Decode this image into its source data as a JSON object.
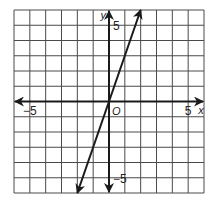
{
  "chart_data": {
    "type": "line",
    "title": "",
    "xlabel": "x",
    "ylabel": "y",
    "origin_label": "O",
    "xlim": [
      -6,
      6
    ],
    "ylim": [
      -6,
      6
    ],
    "grid": true,
    "grid_step": 1,
    "x_tick_labels": [
      {
        "value": -5,
        "label": "−5"
      },
      {
        "value": 5,
        "label": "5"
      }
    ],
    "y_tick_labels": [
      {
        "value": 5,
        "label": "5"
      },
      {
        "value": -5,
        "label": "−5"
      }
    ],
    "series": [
      {
        "name": "y = 3x",
        "equation": "y = 3x",
        "slope": 3,
        "intercept": 0,
        "x": [
          -2,
          0,
          2
        ],
        "y": [
          -6,
          0,
          6
        ],
        "arrows_both_ends": true
      }
    ],
    "legend": null
  },
  "labels": {
    "x_axis": "x",
    "y_axis": "y",
    "origin": "O",
    "x_neg5": "−5",
    "x_pos5": "5",
    "y_pos5": "5",
    "y_neg5": "−5"
  },
  "colors": {
    "grid": "#4a4a4a",
    "axis": "#1a1a1a",
    "line": "#1a1a1a",
    "background": "#ffffff"
  }
}
